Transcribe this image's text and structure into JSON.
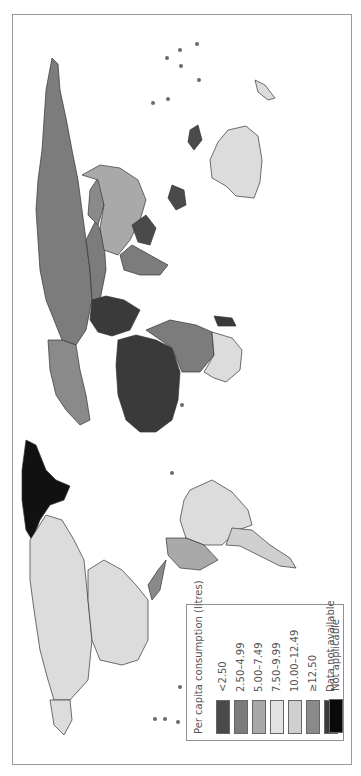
{
  "figure": {
    "type": "choropleth-world-map",
    "orientation": "rotated 90 degrees counter-clockwise"
  },
  "legend": {
    "title": "Per capita consumption (litres)",
    "items": [
      {
        "label": "<2.50",
        "color": "#4a4a4a"
      },
      {
        "label": "2.50–4.99",
        "color": "#7c7c7c"
      },
      {
        "label": "5.00–7.49",
        "color": "#a9a9a9"
      },
      {
        "label": "7.50–9.99",
        "color": "#e2e2e2"
      },
      {
        "label": "10.00–12.49",
        "color": "#cfcfcf"
      },
      {
        "label": "≥12.50",
        "color": "#8a8a8a"
      },
      {
        "label": "Data not available",
        "color": "#3a3a3a"
      },
      {
        "label": "Not applicable",
        "color": "#0a0a0a"
      }
    ]
  },
  "regions": [
    {
      "name": "Russia",
      "color": "#7c7c7c"
    },
    {
      "name": "Australia",
      "color": "#dcdcdc"
    },
    {
      "name": "China",
      "color": "#a9a9a9"
    },
    {
      "name": "Kazakhstan",
      "color": "#7c7c7c"
    },
    {
      "name": "Mongolia",
      "color": "#8a8a8a"
    },
    {
      "name": "India",
      "color": "#7c7c7c"
    },
    {
      "name": "Indonesia",
      "color": "#4a4a4a"
    },
    {
      "name": "Europe",
      "color": "#8a8a8a"
    },
    {
      "name": "Middle East",
      "color": "#3a3a3a"
    },
    {
      "name": "North Africa",
      "color": "#3a3a3a"
    },
    {
      "name": "Sub-Saharan Africa",
      "color": "#7c7c7c"
    },
    {
      "name": "Southern Africa",
      "color": "#dcdcdc"
    },
    {
      "name": "Greenland",
      "color": "#111111"
    },
    {
      "name": "Canada",
      "color": "#dcdcdc"
    },
    {
      "name": "United States",
      "color": "#dcdcdc"
    },
    {
      "name": "Brazil",
      "color": "#dcdcdc"
    },
    {
      "name": "Argentina",
      "color": "#cfcfcf"
    },
    {
      "name": "Andean South America",
      "color": "#a9a9a9"
    },
    {
      "name": "Central America",
      "color": "#8a8a8a"
    }
  ]
}
